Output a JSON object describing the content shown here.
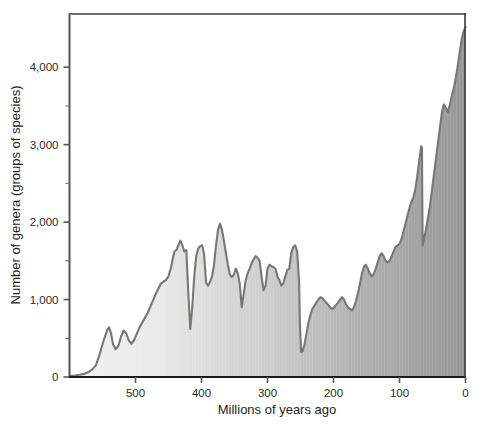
{
  "chart_data": {
    "type": "area",
    "title": "",
    "subtitle": "",
    "xlabel": "Millions of years ago",
    "ylabel": "Number of genera (groups of species)",
    "xlim": [
      600,
      0
    ],
    "ylim": [
      0,
      4700
    ],
    "x_reversed": true,
    "grid": false,
    "legend": null,
    "x_major_ticks": [
      500,
      400,
      300,
      200,
      100,
      0
    ],
    "x_major_tick_labels": [
      "500",
      "400",
      "300",
      "200",
      "100",
      "0"
    ],
    "y_major_ticks": [
      0,
      1000,
      2000,
      3000,
      4000
    ],
    "y_major_tick_labels": [
      "0",
      "1,000",
      "2,000",
      "3,000",
      "4,000"
    ],
    "y_minor_ticks": [
      500,
      1500,
      2500,
      3500
    ],
    "series": [
      {
        "name": "Marine genera diversity",
        "x": [
          600,
          592,
          585,
          578,
          572,
          566,
          560,
          554,
          548,
          543,
          540,
          537,
          534,
          530,
          526,
          522,
          518,
          514,
          510,
          506,
          502,
          498,
          494,
          490,
          486,
          482,
          478,
          474,
          470,
          466,
          462,
          458,
          454,
          450,
          446,
          443,
          441,
          438,
          435,
          432,
          429,
          426,
          423,
          420,
          417,
          414,
          411,
          408,
          405,
          402,
          399,
          396,
          393,
          390,
          387,
          384,
          381,
          378,
          375,
          372,
          369,
          366,
          363,
          360,
          357,
          354,
          351,
          348,
          345,
          342,
          339,
          336,
          333,
          330,
          327,
          324,
          321,
          318,
          315,
          312,
          309,
          306,
          303,
          300,
          297,
          294,
          291,
          288,
          285,
          282,
          279,
          276,
          273,
          270,
          267,
          264,
          261,
          258,
          255,
          252,
          251,
          249,
          247,
          244,
          241,
          238,
          235,
          232,
          229,
          226,
          223,
          220,
          217,
          214,
          211,
          208,
          205,
          202,
          199,
          196,
          193,
          190,
          187,
          184,
          181,
          178,
          175,
          172,
          169,
          166,
          163,
          160,
          157,
          154,
          151,
          148,
          145,
          142,
          139,
          136,
          133,
          130,
          127,
          124,
          121,
          118,
          115,
          112,
          109,
          106,
          103,
          100,
          97,
          94,
          91,
          88,
          85,
          82,
          79,
          76,
          73,
          70,
          67,
          66,
          65,
          63,
          60,
          57,
          54,
          51,
          48,
          45,
          42,
          39,
          36,
          33,
          30,
          27,
          24,
          21,
          18,
          15,
          12,
          9,
          6,
          3,
          0
        ],
        "y": [
          15,
          20,
          28,
          40,
          60,
          95,
          150,
          300,
          480,
          600,
          640,
          560,
          420,
          360,
          400,
          520,
          600,
          560,
          470,
          430,
          480,
          560,
          640,
          700,
          760,
          820,
          900,
          980,
          1060,
          1130,
          1200,
          1230,
          1250,
          1300,
          1420,
          1550,
          1620,
          1640,
          1700,
          1760,
          1700,
          1620,
          1640,
          1090,
          620,
          900,
          1300,
          1560,
          1660,
          1690,
          1700,
          1580,
          1220,
          1180,
          1230,
          1300,
          1450,
          1700,
          1900,
          1980,
          1900,
          1760,
          1600,
          1450,
          1320,
          1290,
          1320,
          1400,
          1340,
          1200,
          900,
          1080,
          1250,
          1340,
          1400,
          1470,
          1520,
          1560,
          1540,
          1500,
          1300,
          1120,
          1180,
          1400,
          1450,
          1430,
          1420,
          1400,
          1300,
          1250,
          1180,
          1210,
          1300,
          1380,
          1400,
          1600,
          1680,
          1700,
          1620,
          1200,
          700,
          320,
          330,
          420,
          560,
          700,
          800,
          880,
          920,
          960,
          1000,
          1030,
          1020,
          990,
          960,
          930,
          900,
          880,
          900,
          930,
          960,
          1000,
          1030,
          1000,
          940,
          900,
          880,
          860,
          900,
          980,
          1080,
          1200,
          1330,
          1420,
          1450,
          1400,
          1340,
          1300,
          1330,
          1400,
          1480,
          1560,
          1600,
          1560,
          1500,
          1480,
          1500,
          1560,
          1620,
          1680,
          1700,
          1720,
          1780,
          1880,
          1980,
          2080,
          2180,
          2260,
          2320,
          2420,
          2600,
          2800,
          2980,
          2960,
          1700,
          1780,
          1900,
          2050,
          2200,
          2400,
          2600,
          2800,
          3000,
          3200,
          3400,
          3520,
          3480,
          3420,
          3500,
          3620,
          3720,
          3850,
          4000,
          4180,
          4350,
          4460,
          4520
        ]
      }
    ],
    "annotations": []
  },
  "style": {
    "line_color": "#777777",
    "fill_left_color": "#efefed",
    "fill_right_color": "#9a9a9a",
    "axis_color": "#555555",
    "text_color": "#1d1d1d",
    "background": "#ffffff"
  }
}
